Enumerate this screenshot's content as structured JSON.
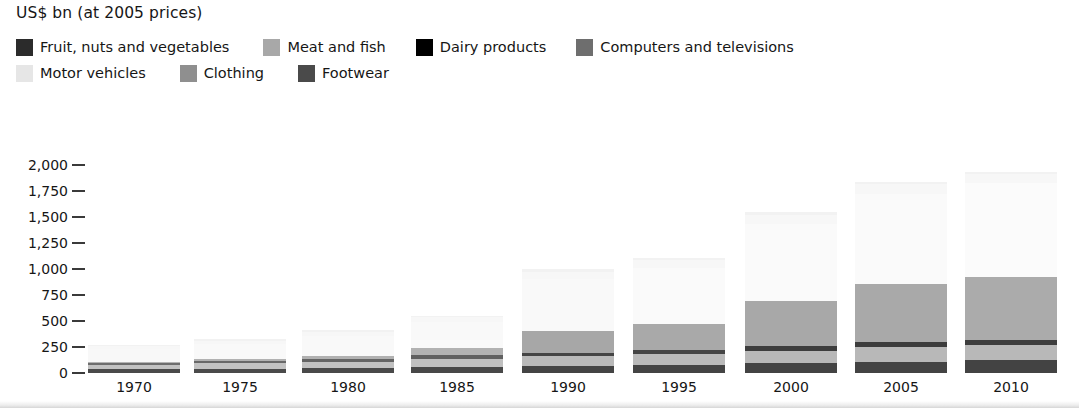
{
  "chart_title": "US$ bn (at 2005 prices)",
  "legend": {
    "rows": [
      [
        {
          "label": "Fruit, nuts and vegetables",
          "color": "#2b2b2b"
        },
        {
          "label": "Meat and fish",
          "color": "#a8a8a8"
        },
        {
          "label": "Dairy products",
          "color": "#000000"
        },
        {
          "label": "Computers and televisions",
          "color": "#6e6e6e"
        }
      ],
      [
        {
          "label": "Motor vehicles",
          "color": "#e6e6e6"
        },
        {
          "label": "Clothing",
          "color": "#8f8f8f"
        },
        {
          "label": "Footwear",
          "color": "#4a4a4a"
        }
      ]
    ]
  },
  "axis": {
    "y_ticks": [
      "2,000",
      "1,750",
      "1,500",
      "1,250",
      "1,000",
      "750",
      "500",
      "250",
      "0"
    ],
    "y_tick_values": [
      2000,
      1750,
      1500,
      1250,
      1000,
      750,
      500,
      250,
      0
    ],
    "y_unit_note": "US$ bn (at 2005 prices)"
  },
  "chart_data": {
    "type": "bar",
    "subtype": "stacked",
    "title": "US$ bn (at 2005 prices)",
    "xlabel": "",
    "ylabel": "US$ bn (at 2005 prices)",
    "ylim": [
      0,
      2000
    ],
    "ytick_interval": 250,
    "grid": false,
    "legend_position": "top",
    "categories": [
      "1970",
      "1975",
      "1980",
      "1985",
      "1990",
      "1995",
      "2000",
      "2005",
      "2010"
    ],
    "series": [
      {
        "name": "Fruit, nuts and vegetables",
        "color": "#2b2b2b",
        "values": [
          35,
          40,
          48,
          60,
          70,
          80,
          95,
          110,
          120
        ]
      },
      {
        "name": "Meat and fish",
        "color": "#a8a8a8",
        "values": [
          45,
          52,
          62,
          78,
          90,
          100,
          118,
          135,
          145
        ]
      },
      {
        "name": "Dairy products",
        "color": "#000000",
        "values": [
          18,
          20,
          24,
          30,
          34,
          38,
          44,
          50,
          55
        ]
      },
      {
        "name": "Computers and televisions",
        "color": "#6e6e6e",
        "values": [
          10,
          18,
          32,
          70,
          210,
          250,
          430,
          560,
          600
        ]
      },
      {
        "name": "Motor vehicles",
        "color": "#e6e6e6",
        "values": [
          120,
          150,
          190,
          250,
          500,
          540,
          740,
          860,
          900
        ]
      },
      {
        "name": "Clothing",
        "color": "#8f8f8f",
        "values": [
          28,
          32,
          40,
          45,
          70,
          75,
          90,
          100,
          88
        ]
      },
      {
        "name": "Footwear",
        "color": "#4a4a4a",
        "values": [
          14,
          13,
          14,
          12,
          26,
          22,
          28,
          20,
          22
        ]
      }
    ],
    "totals": [
      270,
      325,
      410,
      545,
      1000,
      1105,
      1545,
      1835,
      1930
    ]
  },
  "geometry": {
    "baseline_y": 373,
    "px_per_unit": 0.1042,
    "bar_width": 92,
    "bar_centers": [
      134,
      240,
      348,
      457,
      568,
      679,
      791,
      901,
      1011
    ]
  }
}
